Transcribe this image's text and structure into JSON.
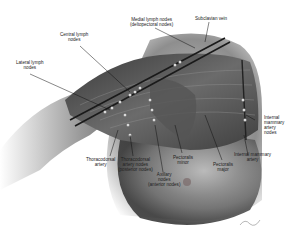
{
  "diagram": {
    "labels": {
      "medial_nodes": [
        "Medial lymph nodes",
        "(deltopectoral nodes)"
      ],
      "subclavian_vein": [
        "Subclavian vein"
      ],
      "central_nodes": [
        "Central lymph",
        "nodes"
      ],
      "lateral_nodes": [
        "Lateral lymph",
        "nodes"
      ],
      "internal_mammary_nodes": [
        "Internal",
        "mammary",
        "artery",
        "nodes"
      ],
      "internal_mammary_artery": [
        "Internal mammary",
        "artery"
      ],
      "pectoralis_major": [
        "Pectoralis",
        "major"
      ],
      "pectoralis_minor": [
        "Pectoralis",
        "minor"
      ],
      "axillary_nodes": [
        "Axillary",
        "nodes",
        "(anterior nodes)"
      ],
      "thoracodorsal_nodes": [
        "Thoracodorsal",
        "artery nodes",
        "(posterior nodes)"
      ],
      "thoracodorsal_artery": [
        "Thoracodorsal",
        "artery"
      ]
    },
    "signature": "artist signature"
  }
}
